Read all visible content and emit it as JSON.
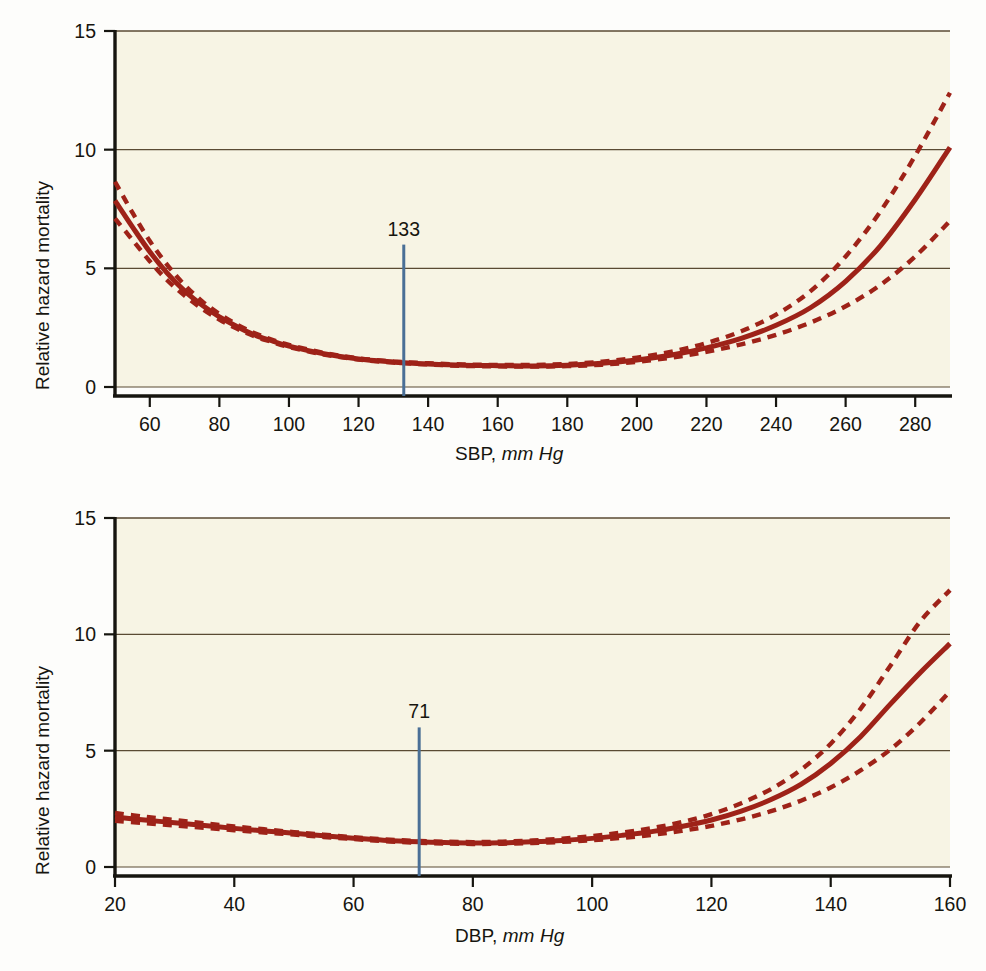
{
  "figure": {
    "title": "",
    "background": "#fdfdfb",
    "plot_background": "#f7f4e4",
    "curve_color": "#9e2218",
    "marker_color": "#4a6f96",
    "grid_color": "#5a4a33",
    "axis_color": "#16150f"
  },
  "chart_data": [
    {
      "id": "sbp",
      "type": "line",
      "title": "",
      "xlabel_main": "SBP,",
      "xlabel_units": "mm Hg",
      "ylabel": "Relative hazard mortality",
      "xlim": [
        50,
        290
      ],
      "ylim": [
        0,
        15
      ],
      "xticks": [
        60,
        80,
        100,
        120,
        140,
        160,
        180,
        200,
        220,
        240,
        260,
        280
      ],
      "xticklabels": [
        "60",
        "80",
        "100",
        "120",
        "140",
        "160",
        "180",
        "200",
        "220",
        "240",
        "260",
        "280"
      ],
      "yticks": [
        0,
        5,
        10,
        15
      ],
      "yticklabels": [
        "0",
        "5",
        "10",
        "15"
      ],
      "grid": true,
      "gridlines_y": [
        0,
        5,
        10,
        15
      ],
      "legend": "none",
      "annotations": [
        {
          "name": "nadir-marker",
          "label": "133",
          "x": 133,
          "y_top": 6.0,
          "y_bottom": 0.0,
          "style": "vertical-line"
        }
      ],
      "series": [
        {
          "name": "Relative hazard (point estimate)",
          "style": "solid",
          "x": [
            50,
            55,
            60,
            65,
            70,
            75,
            80,
            85,
            90,
            95,
            100,
            110,
            120,
            130,
            133,
            140,
            150,
            160,
            170,
            180,
            190,
            200,
            210,
            220,
            230,
            240,
            250,
            260,
            270,
            280,
            290
          ],
          "values": [
            7.85,
            6.75,
            5.7,
            4.8,
            4.05,
            3.45,
            2.95,
            2.55,
            2.2,
            1.95,
            1.72,
            1.4,
            1.18,
            1.05,
            1.02,
            0.97,
            0.92,
            0.9,
            0.89,
            0.92,
            1.0,
            1.14,
            1.35,
            1.65,
            2.05,
            2.6,
            3.35,
            4.45,
            5.95,
            7.9,
            10.1
          ]
        },
        {
          "name": "Upper 95% confidence limit",
          "style": "dashed",
          "x": [
            50,
            55,
            60,
            65,
            70,
            75,
            80,
            85,
            90,
            95,
            100,
            110,
            120,
            130,
            140,
            150,
            160,
            170,
            180,
            190,
            200,
            210,
            220,
            230,
            240,
            250,
            260,
            270,
            280,
            290
          ],
          "values": [
            8.65,
            7.35,
            6.15,
            5.15,
            4.3,
            3.62,
            3.08,
            2.64,
            2.28,
            2.0,
            1.77,
            1.44,
            1.21,
            1.08,
            1.0,
            0.95,
            0.93,
            0.93,
            0.97,
            1.07,
            1.24,
            1.49,
            1.85,
            2.35,
            3.05,
            4.05,
            5.5,
            7.4,
            9.75,
            12.4
          ]
        },
        {
          "name": "Lower 95% confidence limit",
          "style": "dashed",
          "x": [
            50,
            55,
            60,
            65,
            70,
            75,
            80,
            85,
            90,
            95,
            100,
            110,
            120,
            130,
            140,
            150,
            160,
            170,
            180,
            190,
            200,
            210,
            220,
            230,
            240,
            250,
            260,
            270,
            280,
            290
          ],
          "values": [
            7.1,
            6.2,
            5.3,
            4.5,
            3.85,
            3.3,
            2.84,
            2.46,
            2.14,
            1.9,
            1.68,
            1.37,
            1.16,
            1.03,
            0.95,
            0.89,
            0.87,
            0.86,
            0.88,
            0.94,
            1.06,
            1.24,
            1.48,
            1.8,
            2.2,
            2.72,
            3.4,
            4.3,
            5.5,
            7.0
          ]
        }
      ]
    },
    {
      "id": "dbp",
      "type": "line",
      "title": "",
      "xlabel_main": "DBP,",
      "xlabel_units": "mm Hg",
      "ylabel": "Relative hazard mortality",
      "xlim": [
        20,
        160
      ],
      "ylim": [
        0,
        15
      ],
      "xticks": [
        20,
        40,
        60,
        80,
        100,
        120,
        140,
        160
      ],
      "xticklabels": [
        "20",
        "40",
        "60",
        "80",
        "100",
        "120",
        "140",
        "160"
      ],
      "yticks": [
        0,
        5,
        10,
        15
      ],
      "yticklabels": [
        "0",
        "5",
        "10",
        "15"
      ],
      "grid": true,
      "gridlines_y": [
        0,
        5,
        10,
        15
      ],
      "legend": "none",
      "annotations": [
        {
          "name": "nadir-marker",
          "label": "71",
          "x": 71,
          "y_top": 6.0,
          "y_bottom": 0.0,
          "style": "vertical-line"
        }
      ],
      "series": [
        {
          "name": "Relative hazard (point estimate)",
          "style": "solid",
          "x": [
            20,
            25,
            30,
            35,
            40,
            45,
            50,
            55,
            60,
            65,
            71,
            75,
            80,
            85,
            90,
            95,
            100,
            105,
            110,
            115,
            120,
            125,
            130,
            135,
            140,
            145,
            150,
            155,
            160
          ],
          "values": [
            2.15,
            2.02,
            1.9,
            1.78,
            1.66,
            1.55,
            1.45,
            1.34,
            1.24,
            1.15,
            1.08,
            1.05,
            1.03,
            1.04,
            1.08,
            1.14,
            1.23,
            1.36,
            1.52,
            1.74,
            2.02,
            2.4,
            2.9,
            3.55,
            4.45,
            5.6,
            7.0,
            8.35,
            9.6
          ]
        },
        {
          "name": "Upper 95% confidence limit",
          "style": "dashed",
          "x": [
            20,
            25,
            30,
            35,
            40,
            45,
            50,
            55,
            60,
            65,
            71,
            75,
            80,
            85,
            90,
            95,
            100,
            105,
            110,
            115,
            120,
            125,
            130,
            135,
            140,
            145,
            150,
            155,
            160
          ],
          "values": [
            2.32,
            2.16,
            2.02,
            1.88,
            1.74,
            1.62,
            1.5,
            1.39,
            1.28,
            1.19,
            1.12,
            1.09,
            1.07,
            1.09,
            1.14,
            1.22,
            1.33,
            1.48,
            1.67,
            1.93,
            2.27,
            2.74,
            3.35,
            4.18,
            5.3,
            6.8,
            8.65,
            10.55,
            11.9
          ]
        },
        {
          "name": "Lower 95% confidence limit",
          "style": "dashed",
          "x": [
            20,
            25,
            30,
            35,
            40,
            45,
            50,
            55,
            60,
            65,
            71,
            75,
            80,
            85,
            90,
            95,
            100,
            105,
            110,
            115,
            120,
            125,
            130,
            135,
            140,
            145,
            150,
            155,
            160
          ],
          "values": [
            1.98,
            1.88,
            1.78,
            1.68,
            1.58,
            1.48,
            1.39,
            1.29,
            1.2,
            1.11,
            1.04,
            1.01,
            0.99,
            1.0,
            1.03,
            1.08,
            1.15,
            1.25,
            1.38,
            1.55,
            1.77,
            2.05,
            2.4,
            2.85,
            3.42,
            4.15,
            5.05,
            6.2,
            7.55
          ]
        }
      ]
    }
  ]
}
